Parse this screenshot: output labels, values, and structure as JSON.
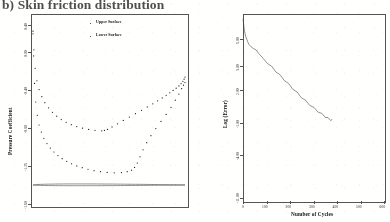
{
  "figure": {
    "caption": "b) Skin friction distribution"
  },
  "left_panel": {
    "legend": [
      {
        "label": "Upper Surface"
      },
      {
        "label": "Lower Surface"
      }
    ]
  },
  "right_panel": {},
  "chart_data": [
    {
      "id": "pressure-distribution",
      "type": "scatter",
      "title": "b) Skin friction distribution",
      "xlabel": "",
      "ylabel": "Pressure Coefficient",
      "ylim": [
        0.4,
        -1.6
      ],
      "yticks": [
        -1.6,
        -1.25,
        -0.8,
        -0.4,
        0.0,
        0.4
      ],
      "yticklabels": [
        "-1.60",
        "-1.25",
        "-0.80",
        "-0.40",
        "0.00",
        "0.40"
      ],
      "xlim": [
        0.0,
        1.0
      ],
      "grid": false,
      "legend": [
        "Upper Surface",
        "Lower Surface"
      ],
      "legend_position": "upper-right",
      "series": [
        {
          "name": "Upper Surface",
          "marker": "dot",
          "x": [
            0.0,
            0.004,
            0.01,
            0.018,
            0.028,
            0.04,
            0.055,
            0.072,
            0.092,
            0.114,
            0.138,
            0.164,
            0.192,
            0.222,
            0.254,
            0.288,
            0.324,
            0.362,
            0.402,
            0.444,
            0.488,
            0.534,
            0.582,
            0.62,
            0.648,
            0.668,
            0.686,
            0.704,
            0.724,
            0.748,
            0.776,
            0.808,
            0.842,
            0.876,
            0.908,
            0.936,
            0.96,
            0.978,
            0.99,
            1.0
          ],
          "y": [
            0.3,
            0.05,
            -0.26,
            -0.47,
            -0.62,
            -0.73,
            -0.81,
            -0.88,
            -0.94,
            -0.99,
            -1.035,
            -1.075,
            -1.11,
            -1.14,
            -1.168,
            -1.192,
            -1.212,
            -1.23,
            -1.246,
            -1.258,
            -1.266,
            -1.27,
            -1.268,
            -1.258,
            -1.24,
            -1.21,
            -1.16,
            -1.09,
            -1.01,
            -0.93,
            -0.85,
            -0.77,
            -0.69,
            -0.61,
            -0.53,
            -0.45,
            -0.38,
            -0.32,
            -0.28,
            -0.25
          ]
        },
        {
          "name": "Lower Surface",
          "marker": "dot",
          "x": [
            0.0,
            0.006,
            0.014,
            0.026,
            0.04,
            0.058,
            0.078,
            0.102,
            0.128,
            0.156,
            0.186,
            0.218,
            0.252,
            0.288,
            0.326,
            0.366,
            0.408,
            0.452,
            0.47,
            0.49,
            0.52,
            0.556,
            0.594,
            0.634,
            0.674,
            0.714,
            0.752,
            0.788,
            0.82,
            0.85,
            0.876,
            0.9,
            0.922,
            0.942,
            0.96,
            0.974,
            0.986,
            0.994,
            1.0
          ],
          "y": [
            0.33,
            0.12,
            -0.09,
            -0.23,
            -0.33,
            -0.41,
            -0.478,
            -0.536,
            -0.586,
            -0.63,
            -0.668,
            -0.7,
            -0.726,
            -0.748,
            -0.766,
            -0.78,
            -0.79,
            -0.796,
            -0.792,
            -0.78,
            -0.752,
            -0.716,
            -0.678,
            -0.64,
            -0.602,
            -0.564,
            -0.526,
            -0.49,
            -0.456,
            -0.424,
            -0.394,
            -0.366,
            -0.34,
            -0.314,
            -0.288,
            -0.262,
            -0.236,
            -0.212,
            -0.188
          ]
        }
      ],
      "annotations": [
        "airfoil profile outline drawn at bottom of axes"
      ]
    },
    {
      "id": "convergence-history",
      "type": "line",
      "title": "",
      "xlabel": "Number of Cycles",
      "ylabel": "Log (Error)",
      "xlim": [
        0,
        600
      ],
      "xticks": [
        0,
        100,
        200,
        300,
        400,
        500,
        600
      ],
      "xticklabels": [
        "0",
        "100",
        "200",
        "300",
        "400",
        "500",
        "600"
      ],
      "ylim": [
        -11.0,
        5.0
      ],
      "yticks": [
        -11.0,
        -8.0,
        -6.0,
        -4.0,
        -1.0,
        2.0,
        3.0,
        5.0
      ],
      "yticklabels": [
        "-11.00",
        "-8.00",
        "-6.00",
        "-4.00",
        "-1.00",
        "2.00",
        "3.00",
        "5.00"
      ],
      "grid": false,
      "series": [
        {
          "name": "Residual",
          "x": [
            0,
            3,
            6,
            9,
            12,
            16,
            20,
            26,
            34,
            44,
            56,
            70,
            86,
            104,
            122,
            140,
            158,
            176,
            194,
            212,
            230,
            248,
            266,
            284,
            302,
            320,
            336,
            350,
            362,
            372,
            380
          ],
          "y": [
            4.6,
            4.1,
            3.6,
            3.3,
            3.05,
            2.85,
            2.62,
            2.38,
            2.2,
            2.05,
            1.92,
            1.55,
            1.2,
            0.85,
            0.48,
            0.12,
            -0.25,
            -0.62,
            -1.0,
            -1.36,
            -1.72,
            -2.08,
            -2.42,
            -2.74,
            -3.04,
            -3.32,
            -3.56,
            -3.76,
            -3.92,
            -4.02,
            -4.08
          ]
        }
      ]
    }
  ]
}
